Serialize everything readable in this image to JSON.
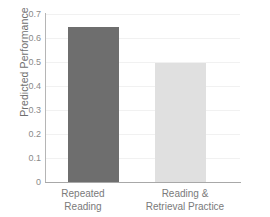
{
  "chart_data": {
    "type": "bar",
    "title": "",
    "xlabel": "",
    "ylabel": "Predicted Performance",
    "categories": [
      "Repeated Reading",
      "Reading & Retrieval Practice"
    ],
    "category_lines": [
      [
        "Repeated",
        "Reading"
      ],
      [
        "Reading &",
        "Retrieval Practice"
      ]
    ],
    "values": [
      0.645,
      0.495
    ],
    "ylim": [
      0,
      0.7
    ],
    "ytick_labels": [
      "0.7",
      "0.6",
      "0.5",
      "0.4",
      "0.3",
      "0.2",
      "0.1",
      "0"
    ],
    "ytick_values": [
      0.7,
      0.6,
      0.5,
      0.4,
      0.3,
      0.2,
      0.1,
      0
    ],
    "grid": true,
    "legend": "none",
    "bar_colors": [
      "#6e6e6e",
      "#e0e0e0"
    ],
    "colors": {
      "background": "#ffffff",
      "gridline": "#f1f1f1",
      "axis": "#aeaeae",
      "tick_text": "#8a8a8a",
      "label_text": "#7a7a7a",
      "axis_title": "#6f6f6f"
    }
  }
}
